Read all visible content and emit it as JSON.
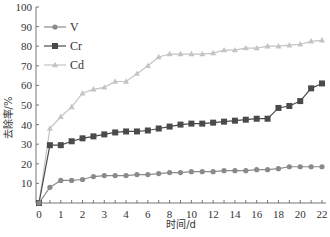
{
  "chart_data": {
    "type": "line",
    "title": "",
    "xlabel": "时间/d",
    "ylabel": "去除率/%",
    "ylim": [
      0,
      100
    ],
    "yticks": [
      0,
      10,
      20,
      30,
      40,
      50,
      60,
      70,
      80,
      90,
      100
    ],
    "x_tick_labels": [
      "0",
      "1",
      "2",
      "3",
      "4",
      "6",
      "8",
      "10",
      "12",
      "14",
      "16",
      "18",
      "20",
      "22"
    ],
    "x_label_every": 2,
    "grid": false,
    "legend_position": "upper-left",
    "point_count": 27,
    "series": [
      {
        "name": "V",
        "color": "#8a8a8a",
        "marker": "diamond",
        "values": [
          0,
          8,
          11.5,
          11.5,
          12,
          13.5,
          14,
          14,
          14,
          14.5,
          14.5,
          15,
          15.5,
          15.5,
          16,
          16,
          16,
          16.5,
          16.5,
          16.5,
          17,
          17,
          17.5,
          18.5,
          18.5,
          18.5,
          18.5
        ]
      },
      {
        "name": "Cr",
        "color": "#4a4a4a",
        "marker": "square",
        "values": [
          0,
          29.5,
          29.5,
          31.5,
          33,
          34,
          35,
          36,
          36.5,
          36.5,
          37,
          38,
          39,
          40,
          40.5,
          40.5,
          41,
          41.5,
          42,
          42.5,
          43,
          43,
          48.5,
          49.5,
          52,
          58.5,
          61
        ]
      },
      {
        "name": "Cd",
        "color": "#c4c4c4",
        "marker": "triangle",
        "values": [
          0,
          38,
          44,
          49,
          56,
          58,
          59,
          62,
          62,
          66,
          70,
          74.5,
          76,
          76,
          76,
          76,
          76.5,
          78,
          78,
          79,
          79,
          80,
          80,
          80.5,
          81,
          82.5,
          83
        ]
      }
    ]
  }
}
